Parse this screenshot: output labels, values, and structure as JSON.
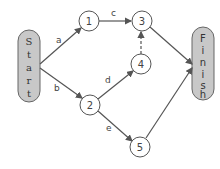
{
  "diagram": {
    "type": "activity-network",
    "start": {
      "label": "Start",
      "letters": [
        "S",
        "t",
        "a",
        "r",
        "t"
      ]
    },
    "finish": {
      "label": "Finish",
      "letters": [
        "F",
        "i",
        "n",
        "i",
        "s",
        "h"
      ]
    },
    "nodes": [
      {
        "id": "1",
        "label": "1"
      },
      {
        "id": "2",
        "label": "2"
      },
      {
        "id": "3",
        "label": "3"
      },
      {
        "id": "4",
        "label": "4"
      },
      {
        "id": "5",
        "label": "5"
      }
    ],
    "edges": [
      {
        "from": "Start",
        "to": "1",
        "label": "a",
        "style": "solid"
      },
      {
        "from": "Start",
        "to": "2",
        "label": "b",
        "style": "solid"
      },
      {
        "from": "1",
        "to": "3",
        "label": "c",
        "style": "solid"
      },
      {
        "from": "2",
        "to": "4",
        "label": "d",
        "style": "solid"
      },
      {
        "from": "2",
        "to": "5",
        "label": "e",
        "style": "solid"
      },
      {
        "from": "4",
        "to": "3",
        "label": "",
        "style": "dashed"
      },
      {
        "from": "3",
        "to": "Finish",
        "label": "",
        "style": "solid"
      },
      {
        "from": "5",
        "to": "Finish",
        "label": "",
        "style": "solid"
      }
    ],
    "colors": {
      "pill_fill": "#c8c8c8",
      "stroke": "#555555",
      "node_fill": "#ffffff"
    }
  }
}
